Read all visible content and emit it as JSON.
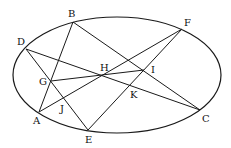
{
  "diagram": {
    "ellipse": {
      "cx": 117,
      "cy": 75,
      "rx": 104,
      "ry": 58
    },
    "points": {
      "A": {
        "x": 39,
        "y": 112
      },
      "B": {
        "x": 73,
        "y": 22
      },
      "C": {
        "x": 200,
        "y": 110
      },
      "D": {
        "x": 26,
        "y": 49
      },
      "E": {
        "x": 88,
        "y": 130
      },
      "F": {
        "x": 182,
        "y": 29
      },
      "G": {
        "x": 51,
        "y": 81
      },
      "H": {
        "x": 105,
        "y": 75
      },
      "I": {
        "x": 144,
        "y": 70
      },
      "J": {
        "x": 64,
        "y": 97
      },
      "K": {
        "x": 132,
        "y": 86
      }
    },
    "segments": [
      [
        "B",
        "A"
      ],
      [
        "B",
        "C"
      ],
      [
        "D",
        "C"
      ],
      [
        "D",
        "E"
      ],
      [
        "A",
        "F"
      ],
      [
        "E",
        "F"
      ],
      [
        "G",
        "I"
      ]
    ],
    "labels": [
      {
        "text": "A",
        "x": 33,
        "y": 124
      },
      {
        "text": "B",
        "x": 68,
        "y": 17
      },
      {
        "text": "C",
        "x": 202,
        "y": 122
      },
      {
        "text": "D",
        "x": 17,
        "y": 45
      },
      {
        "text": "E",
        "x": 85,
        "y": 143
      },
      {
        "text": "F",
        "x": 184,
        "y": 26
      },
      {
        "text": "G",
        "x": 39,
        "y": 85
      },
      {
        "text": "H",
        "x": 100,
        "y": 71
      },
      {
        "text": "I",
        "x": 151,
        "y": 73
      },
      {
        "text": "J",
        "x": 60,
        "y": 112
      },
      {
        "text": "K",
        "x": 130,
        "y": 98
      }
    ]
  }
}
